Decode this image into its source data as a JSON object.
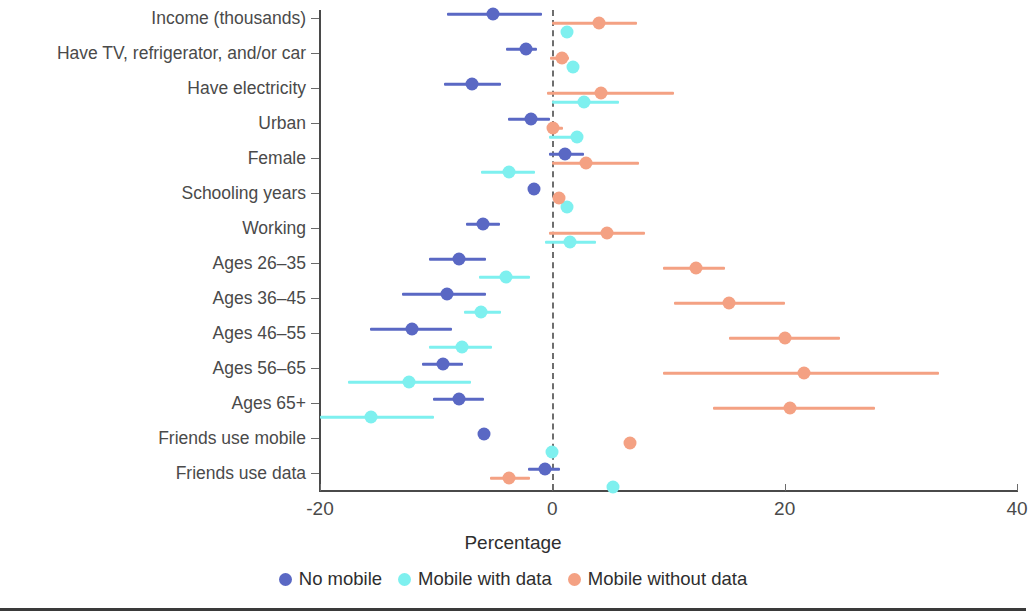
{
  "chart_data": {
    "type": "scatter",
    "title": "",
    "xlabel": "Percentage",
    "ylabel": "",
    "xlim": [
      -20,
      40
    ],
    "xticks": [
      -20,
      0,
      20,
      40
    ],
    "xticklabels": [
      "-20",
      "0",
      "20",
      "40"
    ],
    "grid": false,
    "zero_reference_line": 0,
    "legend_position": "bottom",
    "categories": [
      "Income (thousands)",
      "Have TV, refrigerator, and/or car",
      "Have electricity",
      "Urban",
      "Female",
      "Schooling years",
      "Working",
      "Ages 26–35",
      "Ages 36–45",
      "Ages 46–55",
      "Ages 56–65",
      "Ages 65+",
      "Friends use mobile",
      "Friends use data"
    ],
    "series": [
      {
        "name": "No mobile",
        "color": "#5a68c4",
        "values": [
          -5.1,
          -2.3,
          -6.9,
          -1.8,
          1.1,
          -1.6,
          -6.0,
          -8.0,
          -9.1,
          -12.1,
          -9.4,
          -8.0,
          -5.9,
          -0.6
        ],
        "ci_lower": [
          -9.1,
          -4.0,
          -9.3,
          -3.8,
          -0.3,
          -1.6,
          -7.4,
          -10.6,
          -12.9,
          -15.7,
          -11.2,
          -10.3,
          -5.9,
          -2.1
        ],
        "ci_upper": [
          -0.9,
          -1.3,
          -4.4,
          -0.2,
          2.7,
          -1.6,
          -4.5,
          -5.7,
          -5.7,
          -8.6,
          -7.7,
          -5.9,
          -5.9,
          0.7
        ]
      },
      {
        "name": "Mobile with data",
        "color": "#7ef0ef",
        "values": [
          1.3,
          1.8,
          2.75,
          2.1,
          -3.7,
          1.3,
          1.5,
          -4.0,
          -6.1,
          -7.8,
          -12.3,
          -15.6,
          0.0,
          5.2
        ],
        "ci_lower": [
          1.3,
          1.8,
          0.0,
          -0.3,
          -6.1,
          1.3,
          -0.6,
          -6.3,
          -7.6,
          -10.6,
          -17.6,
          -20.0,
          0.0,
          5.2
        ],
        "ci_upper": [
          1.3,
          1.8,
          5.7,
          2.1,
          -1.5,
          1.3,
          3.8,
          -1.9,
          -4.4,
          -5.2,
          -7.0,
          -10.2,
          0.0,
          5.2
        ]
      },
      {
        "name": "Mobile without data",
        "color": "#f4a183",
        "values": [
          4.0,
          0.8,
          4.2,
          0.1,
          2.9,
          0.6,
          4.7,
          12.4,
          15.2,
          20.0,
          21.7,
          20.5,
          6.7,
          -3.7
        ],
        "ci_lower": [
          0.0,
          -0.2,
          -0.5,
          -0.3,
          0.0,
          0.6,
          -0.3,
          9.5,
          10.5,
          15.2,
          9.5,
          13.8,
          6.7,
          -5.4
        ],
        "ci_upper": [
          7.3,
          1.4,
          10.5,
          0.9,
          7.5,
          0.6,
          8.0,
          14.9,
          20.0,
          24.8,
          33.3,
          27.8,
          6.7,
          -1.9
        ]
      }
    ],
    "legend": [
      {
        "label": "No mobile",
        "color": "#5a68c4",
        "marker": "dot-marker"
      },
      {
        "label": "Mobile with data",
        "color": "#7ef0ef",
        "marker": "dot-marker"
      },
      {
        "label": "Mobile without data",
        "color": "#f4a183",
        "marker": "dot-marker"
      }
    ]
  }
}
